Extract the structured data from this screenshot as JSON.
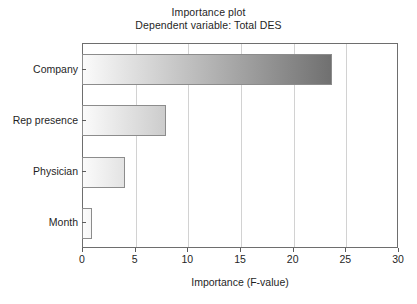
{
  "chart_data": {
    "type": "bar",
    "orientation": "horizontal",
    "title": "Importance plot",
    "subtitle": "Dependent variable: Total DES",
    "xlabel": "Importance (F-value)",
    "ylabel": "",
    "categories": [
      "Company",
      "Rep presence",
      "Physician",
      "Month"
    ],
    "values": [
      23.6,
      7.9,
      4.0,
      0.85
    ],
    "xlim": [
      0,
      30
    ],
    "xticks": [
      0,
      5,
      10,
      15,
      20,
      25,
      30
    ],
    "xtick_labels": [
      "0",
      "5",
      "10",
      "15",
      "20",
      "25",
      "30"
    ],
    "grid": "vertical",
    "legend": null,
    "bar_style": {
      "fill": "horizontal-gradient-light-to-dark",
      "gradient_start": "#fbfbfb",
      "gradient_end": "#707070",
      "border": "#8c8c8c"
    },
    "series": [
      {
        "name": "Importance (F-value)",
        "values": [
          23.6,
          7.9,
          4.0,
          0.85
        ]
      }
    ]
  },
  "figure": {
    "background": "#ffffff",
    "axis_color": "#6e6e6e",
    "grid_color": "#d2d2d2",
    "text_color": "#1f1f1f"
  }
}
